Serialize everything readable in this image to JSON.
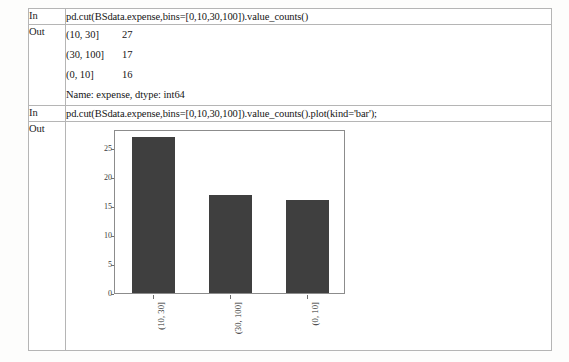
{
  "notebook": {
    "rows": [
      {
        "label": "In",
        "type": "code",
        "code": "pd.cut(BSdata.expense,bins=[0,10,30,100]).value_counts()"
      },
      {
        "label": "Out",
        "type": "text",
        "lines": [
          {
            "bin": "(10, 30]",
            "count": "27"
          },
          {
            "bin": "(30, 100]",
            "count": "17"
          },
          {
            "bin": "(0, 10]",
            "count": "16"
          }
        ],
        "footer": "Name: expense, dtype: int64"
      },
      {
        "label": "In",
        "type": "code",
        "code": "pd.cut(BSdata.expense,bins=[0,10,30,100]).value_counts().plot(kind='bar');"
      },
      {
        "label": "Out",
        "type": "plot"
      }
    ]
  },
  "chart_data": {
    "type": "bar",
    "title": "",
    "xlabel": "",
    "ylabel": "",
    "categories": [
      "(10, 30]",
      "(30, 100]",
      "(0, 10]"
    ],
    "values": [
      27,
      17,
      16
    ],
    "ylim": [
      0,
      28.35
    ],
    "yticks": [
      0,
      5,
      10,
      15,
      20,
      25
    ],
    "ytick_labels": [
      "0",
      "5",
      "10",
      "15",
      "20",
      "25"
    ],
    "grid": false,
    "legend": false,
    "bar_color": "#3f3f3f",
    "axes_color": "#8c8c8c",
    "xtick_rotation": 90
  },
  "colors": {
    "page_background": "#fdfdfc",
    "table_border": "#a9a9a9",
    "cell_border": "#b5b5b5",
    "text": "#151515",
    "bar": "#3f3f3f"
  }
}
